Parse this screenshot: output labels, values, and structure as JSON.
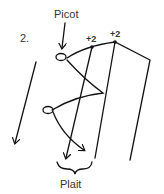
{
  "diagram": {
    "step_number": "2.",
    "labels": {
      "picot": "Picot",
      "plait": "Plait",
      "count_left": "+2",
      "count_right": "+2"
    },
    "colors": {
      "stroke": "#111111",
      "text": "#333333",
      "background": "#ffffff"
    }
  }
}
